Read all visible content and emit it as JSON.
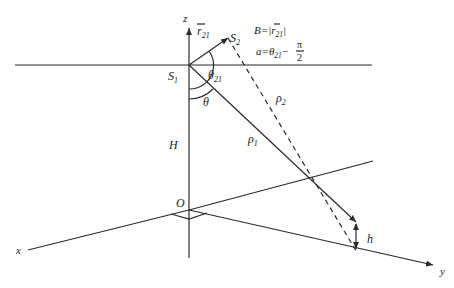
{
  "diagram": {
    "type": "geometry-3d-coordinate",
    "axes": {
      "x_label": "x",
      "y_label": "y",
      "z_label": "z",
      "origin_label": "O"
    },
    "points": {
      "s1_label": "S",
      "s1_sub": "1",
      "s2_label": "S",
      "s2_sub": "2"
    },
    "vector": {
      "r_label": "r",
      "r_sub": "21"
    },
    "angles": {
      "theta21_label": "θ",
      "theta21_sub": "21",
      "theta_label": "θ"
    },
    "distances": {
      "rho1_label": "ρ",
      "rho1_sub": "1",
      "rho2_label": "ρ",
      "rho2_sub": "2",
      "H_label": "H",
      "h_label": "h"
    },
    "formulas": {
      "B_lhs": "B",
      "B_eq": "=|",
      "B_r": "r",
      "B_sub": "21",
      "B_close": "|",
      "a_lhs": "a",
      "a_eq": "=",
      "a_theta": "θ",
      "a_sub": "21",
      "a_minus": "−",
      "a_num": "π",
      "a_den": "2"
    }
  }
}
